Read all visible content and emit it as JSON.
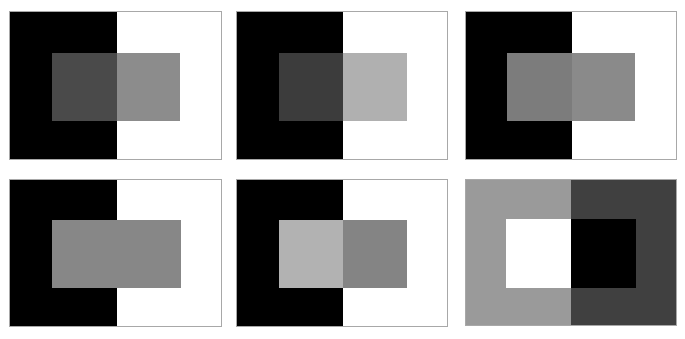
{
  "figure": {
    "panels": [
      {
        "id": "panel-1",
        "row": 1,
        "col": 1,
        "box": {
          "x": 9,
          "y": 11,
          "w": 213,
          "h": 149
        },
        "split_x": 107,
        "outer_left_color": "#000000",
        "outer_right_color": "#ffffff",
        "inner_box": {
          "x": 42,
          "y": 41,
          "w": 128,
          "h": 68
        },
        "inner_left_color": "#4a4a4a",
        "inner_right_color": "#8c8c8c"
      },
      {
        "id": "panel-2",
        "row": 1,
        "col": 2,
        "box": {
          "x": 236,
          "y": 11,
          "w": 212,
          "h": 149
        },
        "split_x": 106,
        "outer_left_color": "#000000",
        "outer_right_color": "#ffffff",
        "inner_box": {
          "x": 42,
          "y": 41,
          "w": 128,
          "h": 68
        },
        "inner_left_color": "#3c3c3c",
        "inner_right_color": "#b0b0b0"
      },
      {
        "id": "panel-3",
        "row": 1,
        "col": 3,
        "box": {
          "x": 465,
          "y": 11,
          "w": 212,
          "h": 149
        },
        "split_x": 106,
        "outer_left_color": "#000000",
        "outer_right_color": "#ffffff",
        "inner_box": {
          "x": 41,
          "y": 41,
          "w": 128,
          "h": 68
        },
        "inner_left_color": "#7c7c7c",
        "inner_right_color": "#8a8a8a"
      },
      {
        "id": "panel-4",
        "row": 2,
        "col": 1,
        "box": {
          "x": 9,
          "y": 179,
          "w": 213,
          "h": 148
        },
        "split_x": 107,
        "outer_left_color": "#000000",
        "outer_right_color": "#ffffff",
        "inner_box": {
          "x": 42,
          "y": 40,
          "w": 129,
          "h": 68
        },
        "inner_left_color": "#878787",
        "inner_right_color": "#878787"
      },
      {
        "id": "panel-5",
        "row": 2,
        "col": 2,
        "box": {
          "x": 236,
          "y": 179,
          "w": 212,
          "h": 148
        },
        "split_x": 106,
        "outer_left_color": "#000000",
        "outer_right_color": "#ffffff",
        "inner_box": {
          "x": 42,
          "y": 40,
          "w": 128,
          "h": 68
        },
        "inner_left_color": "#b2b2b2",
        "inner_right_color": "#848484"
      },
      {
        "id": "panel-6",
        "row": 2,
        "col": 3,
        "box": {
          "x": 465,
          "y": 179,
          "w": 212,
          "h": 147
        },
        "split_x": 105,
        "outer_left_color": "#9a9a9a",
        "outer_right_color": "#404040",
        "inner_box": {
          "x": 40,
          "y": 39,
          "w": 130,
          "h": 69
        },
        "inner_left_color": "#ffffff",
        "inner_right_color": "#000000"
      }
    ]
  }
}
